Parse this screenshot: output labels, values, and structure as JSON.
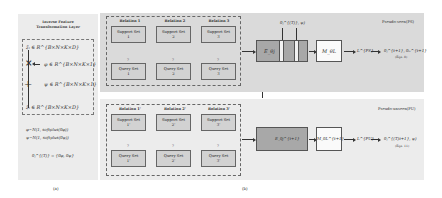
{
  "panel_a": {
    "title_line1": "Inverse Feature",
    "title_line2": "Transformation Layer",
    "eq_z": "z̃ᵢ ∈ R^{B×N×K×D}",
    "eq_phi": "φ ∈ R^{B×N×K×1}",
    "eq_psi": "ψ ∈ R^{B×N×K×1}",
    "eq_zout": "z̃ᵢ ∈ R^{B×N×K×D}",
    "op_multiply": "×",
    "op_add": "+",
    "dist_phi": "φ~N(1, softplus(θφ))",
    "dist_psi": "ψ~N(1, softplus(θψ))",
    "theta_def": "θⱼ^{(T)} = {θφ, θψ}",
    "caption": "(a)"
  },
  "panel_b": {
    "caption": "(b)",
    "top": {
      "label": "Pseudo-seen(PS)",
      "relations": [
        "Relation 1",
        "Relation 2",
        "Relation 3"
      ],
      "support_sets": [
        [
          "Support Set",
          "1"
        ],
        [
          "Support Set",
          "2"
        ],
        [
          "Support Set",
          "3"
        ]
      ],
      "query_sets": [
        [
          "Query Set",
          "1"
        ],
        [
          "Query Set",
          "2"
        ],
        [
          "Query Set",
          "3"
        ]
      ],
      "qmark": "?",
      "encoder": "E_θj",
      "theta_input": "θⱼ^{(T)}, ψ)",
      "m_box": "M_θL",
      "loss": "L^{PS}",
      "output": "θⱼ^{t+1}, θₘ^{t+1}",
      "eqn": "(Eqn. 8)"
    },
    "bottom": {
      "label": "Pseudo-unseen(PU)",
      "relations": [
        "Relation 1'",
        "Relation 2'",
        "Relation 3'"
      ],
      "support_sets": [
        [
          "Support Set",
          "1'"
        ],
        [
          "Support Set",
          "2'"
        ],
        [
          "Support Set",
          "3'"
        ]
      ],
      "query_sets": [
        [
          "Query Set",
          "1'"
        ],
        [
          "Query Set",
          "2'"
        ],
        [
          "Query Set",
          "3'"
        ]
      ],
      "qmark": "?",
      "encoder": "E_θj^{t+1}",
      "m_box": "M_θL^{t+1}",
      "loss": "L^{PU}",
      "output": "θⱼ^{(T)t+1}, ψ)",
      "eqn": "(Eqn. 11)"
    }
  },
  "colors": {
    "panel_top": "#dadada",
    "panel_bottom": "#ececec",
    "encoder": "#a8a8a8",
    "set_box": "#d2d2d2"
  }
}
